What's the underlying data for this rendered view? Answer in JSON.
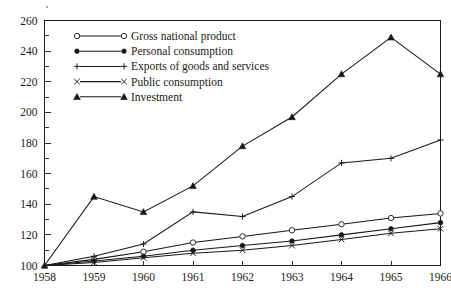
{
  "chart_data": {
    "type": "line",
    "title": "",
    "subtitle": "",
    "xlabel": "",
    "ylabel": "",
    "categories": [
      "1958",
      "1959",
      "1960",
      "1961",
      "1962",
      "1963",
      "1964",
      "1965",
      "1966"
    ],
    "x": [
      1958,
      1959,
      1960,
      1961,
      1962,
      1963,
      1964,
      1965,
      1966
    ],
    "xlim": [
      1958,
      1966
    ],
    "ylim": [
      100,
      260
    ],
    "y_ticks_major": [
      100,
      120,
      140,
      160,
      180,
      200,
      220,
      240,
      260
    ],
    "y_ticks_minor": [
      110,
      130,
      150,
      170,
      190,
      210,
      230,
      250
    ],
    "grid": "off",
    "legend_position": "upper-left-inside",
    "series": [
      {
        "name": "Gross national product",
        "marker": "open-circle",
        "values": [
          100,
          104,
          109,
          115,
          119,
          123,
          127,
          131,
          134
        ]
      },
      {
        "name": "Personal consumption",
        "marker": "filled-circle",
        "values": [
          100,
          103,
          106,
          110,
          113,
          116,
          120,
          124,
          128
        ]
      },
      {
        "name": "Exports of goods and services",
        "marker": "plus",
        "values": [
          100,
          106,
          114,
          135,
          132,
          145,
          167,
          170,
          182
        ]
      },
      {
        "name": "Public consumption",
        "marker": "cross",
        "values": [
          100,
          102,
          105,
          108,
          110,
          113,
          117,
          121,
          124
        ]
      },
      {
        "name": "Investment",
        "marker": "filled-triangle",
        "values": [
          100,
          145,
          135,
          152,
          178,
          197,
          225,
          249,
          225
        ]
      }
    ]
  },
  "legend": {
    "items": [
      {
        "label": "Gross national product",
        "marker": "open-circle"
      },
      {
        "label": "Personal consumption",
        "marker": "filled-circle"
      },
      {
        "label": "Exports of goods and services",
        "marker": "plus"
      },
      {
        "label": "Public consumption",
        "marker": "cross"
      },
      {
        "label": "Investment",
        "marker": "filled-triangle"
      }
    ]
  },
  "axis": {
    "y_labels": [
      "260",
      "240",
      "220",
      "200",
      "180",
      "160",
      "140",
      "120",
      "100"
    ],
    "x_labels": [
      "1958",
      "1959",
      "1960",
      "1961",
      "1962",
      "1963",
      "1964",
      "1965",
      "1966"
    ]
  }
}
